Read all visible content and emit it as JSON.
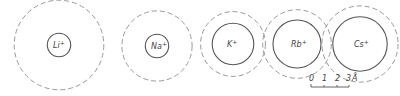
{
  "figure": {
    "ions": [
      {
        "symbol": "Li",
        "charge": "+",
        "ionic_radius_A": 0.6,
        "hydrated_radius_A": 2.3
      },
      {
        "symbol": "Na",
        "charge": "+",
        "ionic_radius_A": 0.6,
        "hydrated_radius_A": 1.8
      },
      {
        "symbol": "K",
        "charge": "+",
        "ionic_radius_A": 1.3,
        "hydrated_radius_A": 1.25
      },
      {
        "symbol": "Rb",
        "charge": "+",
        "ionic_radius_A": 1.5,
        "hydrated_radius_A": 1.3
      },
      {
        "symbol": "Cs",
        "charge": "+",
        "ionic_radius_A": 1.7,
        "hydrated_radius_A": 1.3
      }
    ],
    "scale_bar": {
      "ticks": [
        "0",
        "1",
        "2",
        "3"
      ],
      "unit": "Å"
    },
    "colors": {
      "inner_stroke": "#555555",
      "outer_stroke": "#999999"
    }
  }
}
